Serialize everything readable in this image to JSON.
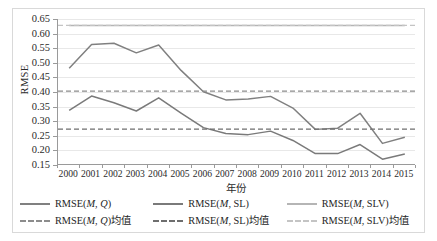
{
  "chart_data": {
    "type": "line",
    "title": "",
    "xlabel": "年份",
    "ylabel": "RMSE",
    "categories": [
      "2000",
      "2001",
      "2002",
      "2003",
      "2004",
      "2005",
      "2006",
      "2007",
      "2008",
      "2009",
      "2010",
      "2011",
      "2012",
      "2013",
      "2014",
      "2015"
    ],
    "ylim": [
      0.15,
      0.65
    ],
    "ytick_labels": [
      "0.65",
      "0.60",
      "0.55",
      "0.50",
      "0.45",
      "0.40",
      "0.35",
      "0.30",
      "0.25",
      "0.20",
      "0.15"
    ],
    "ytick_values": [
      0.65,
      0.6,
      0.55,
      0.5,
      0.45,
      0.4,
      0.35,
      0.3,
      0.25,
      0.2,
      0.15
    ],
    "grid": true,
    "legend_position": "bottom",
    "series": [
      {
        "name": "RMSE(M, Q)",
        "style": "solid",
        "color": "#808080",
        "values": [
          0.481,
          0.563,
          0.567,
          0.534,
          0.561,
          0.474,
          0.401,
          0.373,
          0.376,
          0.385,
          0.345,
          0.272,
          0.276,
          0.327,
          0.224,
          0.245
        ]
      },
      {
        "name": "RMSE(M, SL)",
        "style": "solid",
        "color": "#7a7a7a",
        "values": [
          0.337,
          0.386,
          0.363,
          0.335,
          0.38,
          0.328,
          0.278,
          0.258,
          0.254,
          0.266,
          0.234,
          0.189,
          0.189,
          0.22,
          0.17,
          0.188
        ]
      },
      {
        "name": "RMSE(M, SLV)",
        "style": "solid",
        "color": "#b5b5b5",
        "values": [
          0.628,
          0.628,
          0.628,
          0.628,
          0.628,
          0.628,
          0.628,
          0.628,
          0.628,
          0.628,
          0.628,
          0.628,
          0.628,
          0.628,
          0.628,
          0.628
        ]
      },
      {
        "name": "RMSE(M, Q)均值",
        "style": "dashed",
        "color": "#8c8c8c",
        "constant": 0.403
      },
      {
        "name": "RMSE(M, SL)均值",
        "style": "dashed",
        "color": "#6e6e6e",
        "constant": 0.273
      },
      {
        "name": "RMSE(M, SLV)均值",
        "style": "dashed",
        "color": "#c4c4c4",
        "constant": 0.628
      }
    ]
  },
  "axes": {
    "y_title": "RMSE",
    "x_title": "年份"
  },
  "legend": {
    "row1": [
      {
        "label_prefix": "RMSE(",
        "label_italic": "M",
        "label_suffix": ", ",
        "label_italic2": "Q",
        "label_end": ")",
        "full": "RMSE(M, Q)"
      },
      {
        "full": "RMSE(M, SL)"
      },
      {
        "full": "RMSE(M, SLV)"
      }
    ],
    "row2": [
      {
        "full": "RMSE(M, Q)均值"
      },
      {
        "full": "RMSE(M, SL)均值"
      },
      {
        "full": "RMSE(M, SLV)均值"
      }
    ]
  },
  "colors": {
    "series_q": "#808080",
    "series_sl": "#7a7a7a",
    "series_slv": "#b5b5b5",
    "mean_q": "#8c8c8c",
    "mean_sl": "#6e6e6e",
    "mean_slv": "#c4c4c4",
    "grid": "#e8e8e8",
    "axis": "#9a9a9a",
    "text": "#2b2b2b"
  }
}
